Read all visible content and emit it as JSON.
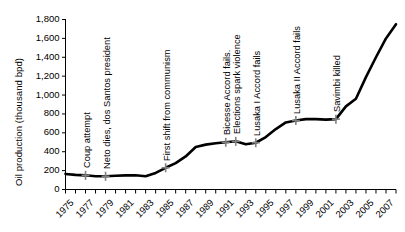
{
  "chart_data": {
    "type": "line",
    "title": "",
    "xlabel": "",
    "ylabel": "Oil production (thousand bpd)",
    "xlim": [
      1975,
      2008
    ],
    "ylim": [
      0,
      1800
    ],
    "grid": false,
    "legend": "none",
    "y_ticks": [
      "0",
      "200",
      "400",
      "600",
      "800",
      "1,000",
      "1,200",
      "1,400",
      "1,600",
      "1,800"
    ],
    "y_tick_values": [
      0,
      200,
      400,
      600,
      800,
      1000,
      1200,
      1400,
      1600,
      1800
    ],
    "x_ticks": [
      "1975",
      "1977",
      "1979",
      "1981",
      "1983",
      "1985",
      "1987",
      "1989",
      "1991",
      "1993",
      "1995",
      "1997",
      "1999",
      "2001",
      "2003",
      "2005",
      "2007"
    ],
    "x_tick_values": [
      1975,
      1977,
      1979,
      1981,
      1983,
      1985,
      1987,
      1989,
      1991,
      1993,
      1995,
      1997,
      1999,
      2001,
      2003,
      2005,
      2007
    ],
    "x_minor_ticks": [
      1975,
      1976,
      1977,
      1978,
      1979,
      1980,
      1981,
      1982,
      1983,
      1984,
      1985,
      1986,
      1987,
      1988,
      1989,
      1990,
      1991,
      1992,
      1993,
      1994,
      1995,
      1996,
      1997,
      1998,
      1999,
      2000,
      2001,
      2002,
      2003,
      2004,
      2005,
      2006,
      2007,
      2008
    ],
    "line_color": "#000000",
    "line_width": 2.6,
    "series": [
      {
        "name": "Oil production",
        "x": [
          1975,
          1976,
          1977,
          1978,
          1979,
          1980,
          1981,
          1982,
          1983,
          1984,
          1985,
          1986,
          1987,
          1988,
          1989,
          1990,
          1991,
          1992,
          1993,
          1994,
          1995,
          1996,
          1997,
          1998,
          1999,
          2000,
          2001,
          2002,
          2003,
          2004,
          2005,
          2006,
          2007,
          2008
        ],
        "values": [
          165,
          155,
          150,
          140,
          140,
          145,
          150,
          150,
          140,
          175,
          230,
          280,
          350,
          450,
          475,
          490,
          500,
          510,
          480,
          495,
          555,
          640,
          710,
          730,
          745,
          745,
          740,
          745,
          880,
          960,
          1190,
          1400,
          1600,
          1750
        ]
      }
    ],
    "annotations": [
      {
        "id": "coup-attempt",
        "label": "Coup attempt",
        "year": 1977,
        "value": 150
      },
      {
        "id": "neto-dies",
        "label": "Neto dies, dos Santos president",
        "year": 1979,
        "value": 140
      },
      {
        "id": "first-shift-communism",
        "label": "First shift from communism",
        "year": 1985,
        "value": 230
      },
      {
        "id": "bicesse-accord-fails",
        "label": "Bicesse Accord fails.",
        "year": 1991,
        "value": 500
      },
      {
        "id": "elections-spark-violence",
        "label": "Elections spark violence",
        "year": 1992,
        "value": 510
      },
      {
        "id": "lusaka-i-accord-fails",
        "label": "Lusaka I Accord fails",
        "year": 1994,
        "value": 495
      },
      {
        "id": "lusaka-ii-accord-fails",
        "label": "Lusaka II Accord fails",
        "year": 1998,
        "value": 730
      },
      {
        "id": "savimbi-killed",
        "label": "Savimbi killed",
        "year": 2002,
        "value": 745
      }
    ],
    "marker_color": "#808080",
    "marker_symbol": "plus"
  }
}
